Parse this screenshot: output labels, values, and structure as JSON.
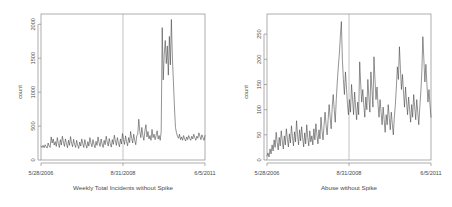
{
  "figure": {
    "background": "#ffffff",
    "line_color": "#3a3a3a",
    "frame_color": "#8a8a8a",
    "vline_color": "#9a9a9a",
    "panel_count": 2
  },
  "chart_data": [
    {
      "type": "line",
      "title": "Weekly Total Incidents without Spike",
      "xlabel": "Weekly Total Incidents without Spike",
      "ylabel": "count",
      "ylim": [
        0,
        2150
      ],
      "yticks": [
        0,
        500,
        1000,
        1500,
        2000
      ],
      "ytick_labels": [
        "0",
        "500",
        "1000",
        "1500",
        "2000"
      ],
      "xtick_labels": [
        "5/28/2006",
        "8/31/2008",
        "6/5/2011"
      ],
      "xtick_positions": [
        0,
        0.5,
        1.0
      ],
      "grid": false,
      "legend": "none",
      "annotations": [
        {
          "type": "vline",
          "x": 0.5,
          "label": "8/31/2008"
        }
      ],
      "x": [
        0,
        0.0062,
        0.0124,
        0.0186,
        0.0248,
        0.031,
        0.0372,
        0.0435,
        0.0497,
        0.0559,
        0.0621,
        0.0683,
        0.0745,
        0.0807,
        0.0869,
        0.0932,
        0.0994,
        0.1056,
        0.1118,
        0.118,
        0.1242,
        0.1304,
        0.1366,
        0.1429,
        0.1491,
        0.1553,
        0.1615,
        0.1677,
        0.1739,
        0.1801,
        0.1863,
        0.1925,
        0.1988,
        0.205,
        0.2112,
        0.2174,
        0.2236,
        0.2298,
        0.236,
        0.2422,
        0.2484,
        0.2547,
        0.2609,
        0.2671,
        0.2733,
        0.2795,
        0.2857,
        0.2919,
        0.2981,
        0.3043,
        0.3106,
        0.3168,
        0.323,
        0.3292,
        0.3354,
        0.3416,
        0.3478,
        0.354,
        0.3602,
        0.3665,
        0.3727,
        0.3789,
        0.3851,
        0.3913,
        0.3975,
        0.4037,
        0.4099,
        0.4161,
        0.4224,
        0.4286,
        0.4348,
        0.441,
        0.4472,
        0.4534,
        0.4596,
        0.4658,
        0.472,
        0.4783,
        0.4845,
        0.4907,
        0.4969,
        0.5031,
        0.5093,
        0.5155,
        0.5217,
        0.528,
        0.5342,
        0.5404,
        0.5466,
        0.5528,
        0.559,
        0.5652,
        0.5714,
        0.5776,
        0.5839,
        0.5901,
        0.5963,
        0.6025,
        0.6087,
        0.6149,
        0.6211,
        0.6273,
        0.6335,
        0.6398,
        0.646,
        0.6522,
        0.6584,
        0.6646,
        0.6708,
        0.677,
        0.6832,
        0.6894,
        0.6957,
        0.7019,
        0.7081,
        0.7143,
        0.7205,
        0.7267,
        0.7329,
        0.7391,
        0.7453,
        0.7516,
        0.7578,
        0.764,
        0.7702,
        0.7764,
        0.7826,
        0.7888,
        0.795,
        0.8012,
        0.8075,
        0.8137,
        0.8199,
        0.8261,
        0.8323,
        0.8385,
        0.8447,
        0.8509,
        0.8571,
        0.8634,
        0.8696,
        0.8758,
        0.882,
        0.8882,
        0.8944,
        0.9006,
        0.9068,
        0.913,
        0.9193,
        0.9255,
        0.9317,
        0.9379,
        0.9441,
        0.9503,
        0.9565,
        0.9627,
        0.9689,
        0.9752,
        0.9814,
        0.9876,
        0.9938,
        1.0
      ],
      "values": [
        205,
        185,
        215,
        180,
        225,
        195,
        175,
        250,
        205,
        185,
        340,
        250,
        310,
        220,
        270,
        200,
        330,
        245,
        185,
        300,
        220,
        350,
        265,
        200,
        310,
        240,
        180,
        290,
        215,
        345,
        250,
        195,
        305,
        230,
        185,
        290,
        220,
        170,
        265,
        205,
        310,
        240,
        185,
        300,
        225,
        175,
        270,
        205,
        330,
        250,
        195,
        300,
        230,
        180,
        275,
        215,
        340,
        255,
        200,
        310,
        235,
        185,
        290,
        225,
        350,
        265,
        205,
        315,
        240,
        190,
        300,
        230,
        365,
        280,
        215,
        330,
        250,
        195,
        310,
        235,
        390,
        300,
        230,
        355,
        270,
        210,
        330,
        255,
        420,
        320,
        250,
        380,
        290,
        225,
        355,
        380,
        600,
        420,
        330,
        480,
        360,
        290,
        430,
        520,
        340,
        420,
        310,
        360,
        290,
        450,
        330,
        380,
        300,
        360,
        430,
        310,
        360,
        290,
        420,
        1950,
        1180,
        1560,
        1760,
        1420,
        1680,
        1250,
        1820,
        1400,
        2070,
        1500,
        1150,
        780,
        480,
        400,
        350,
        320,
        380,
        300,
        340,
        290,
        360,
        310,
        280,
        340,
        300,
        360,
        320,
        290,
        350,
        310,
        380,
        330,
        290,
        350,
        320,
        400,
        350,
        300,
        370,
        330,
        290,
        360,
        320,
        880,
        650,
        430,
        520,
        400,
        480,
        1060,
        700,
        520,
        620,
        470,
        400,
        560,
        480,
        420,
        530,
        460,
        390,
        520,
        450,
        380,
        560,
        490,
        420,
        980,
        620,
        430
      ]
    },
    {
      "type": "line",
      "title": "Abuse without Spike",
      "xlabel": "Abuse without Spike",
      "ylabel": "count",
      "ylim": [
        0,
        290
      ],
      "yticks": [
        0,
        50,
        100,
        150,
        200,
        250
      ],
      "ytick_labels": [
        "0",
        "50",
        "100",
        "150",
        "200",
        "250"
      ],
      "xtick_labels": [
        "5/28/2006",
        "8/31/2008",
        "6/5/2011"
      ],
      "xtick_positions": [
        0,
        0.5,
        1.0
      ],
      "grid": false,
      "legend": "none",
      "annotations": [
        {
          "type": "vline",
          "x": 0.5,
          "label": "8/31/2008"
        }
      ],
      "x": [
        0,
        0.0062,
        0.0124,
        0.0186,
        0.0248,
        0.031,
        0.0372,
        0.0435,
        0.0497,
        0.0559,
        0.0621,
        0.0683,
        0.0745,
        0.0807,
        0.0869,
        0.0932,
        0.0994,
        0.1056,
        0.1118,
        0.118,
        0.1242,
        0.1304,
        0.1366,
        0.1429,
        0.1491,
        0.1553,
        0.1615,
        0.1677,
        0.1739,
        0.1801,
        0.1863,
        0.1925,
        0.1988,
        0.205,
        0.2112,
        0.2174,
        0.2236,
        0.2298,
        0.236,
        0.2422,
        0.2484,
        0.2547,
        0.2609,
        0.2671,
        0.2733,
        0.2795,
        0.2857,
        0.2919,
        0.2981,
        0.3043,
        0.3106,
        0.3168,
        0.323,
        0.3292,
        0.3354,
        0.3416,
        0.3478,
        0.354,
        0.3602,
        0.3665,
        0.3727,
        0.3789,
        0.3851,
        0.3913,
        0.3975,
        0.4037,
        0.4099,
        0.4161,
        0.4224,
        0.4286,
        0.4348,
        0.441,
        0.4472,
        0.4534,
        0.4596,
        0.4658,
        0.472,
        0.4783,
        0.4845,
        0.4907,
        0.4969,
        0.5031,
        0.5093,
        0.5155,
        0.5217,
        0.528,
        0.5342,
        0.5404,
        0.5466,
        0.5528,
        0.559,
        0.5652,
        0.5714,
        0.5776,
        0.5839,
        0.5901,
        0.5963,
        0.6025,
        0.6087,
        0.6149,
        0.6211,
        0.6273,
        0.6335,
        0.6398,
        0.646,
        0.6522,
        0.6584,
        0.6646,
        0.6708,
        0.677,
        0.6832,
        0.6894,
        0.6957,
        0.7019,
        0.7081,
        0.7143,
        0.7205,
        0.7267,
        0.7329,
        0.7391,
        0.7453,
        0.7516,
        0.7578,
        0.764,
        0.7702,
        0.7764,
        0.7826,
        0.7888,
        0.795,
        0.8012,
        0.8075,
        0.8137,
        0.8199,
        0.8261,
        0.8323,
        0.8385,
        0.8447,
        0.8509,
        0.8571,
        0.8634,
        0.8696,
        0.8758,
        0.882,
        0.8882,
        0.8944,
        0.9006,
        0.9068,
        0.913,
        0.9193,
        0.9255,
        0.9317,
        0.9379,
        0.9441,
        0.9503,
        0.9565,
        0.9627,
        0.9689,
        0.9752,
        0.9814,
        0.9876,
        0.9938,
        1.0
      ],
      "values": [
        8,
        14,
        6,
        22,
        12,
        30,
        18,
        40,
        25,
        55,
        35,
        20,
        45,
        28,
        58,
        38,
        22,
        48,
        30,
        62,
        42,
        26,
        52,
        34,
        68,
        46,
        28,
        56,
        36,
        78,
        50,
        30,
        60,
        38,
        66,
        44,
        26,
        54,
        32,
        70,
        45,
        28,
        58,
        36,
        48,
        30,
        62,
        40,
        72,
        50,
        32,
        60,
        42,
        85,
        58,
        40,
        68,
        95,
        70,
        50,
        80,
        110,
        85,
        62,
        105,
        130,
        100,
        75,
        120,
        155,
        185,
        210,
        245,
        275,
        200,
        160,
        130,
        175,
        145,
        110,
        90,
        120,
        95,
        150,
        120,
        90,
        135,
        105,
        80,
        115,
        90,
        195,
        150,
        115,
        140,
        110,
        85,
        125,
        100,
        160,
        125,
        95,
        175,
        140,
        105,
        205,
        160,
        120,
        145,
        110,
        85,
        120,
        95,
        70,
        105,
        80,
        55,
        90,
        70,
        110,
        85,
        60,
        95,
        72,
        50,
        85,
        110,
        145,
        185,
        160,
        225,
        180,
        140,
        170,
        135,
        105,
        145,
        115,
        90,
        125,
        100,
        75,
        110,
        85,
        130,
        105,
        80,
        120,
        95,
        70,
        105,
        135,
        175,
        245,
        200,
        155,
        190,
        150,
        115,
        140,
        110,
        85,
        120,
        95,
        115,
        90,
        70,
        105,
        125,
        100,
        75,
        110,
        85,
        60
      ]
    }
  ],
  "panels": [
    {
      "id": "left-panel",
      "title": "Weekly Total Incidents without Spike",
      "ylabel": "count",
      "ytick_labels": [
        "0",
        "500",
        "1000",
        "1500",
        "2000"
      ],
      "xtick_labels": [
        "5/28/2006",
        "8/31/2008",
        "6/5/2011"
      ]
    },
    {
      "id": "right-panel",
      "title": "Abuse without Spike",
      "ylabel": "count",
      "ytick_labels": [
        "0",
        "50",
        "100",
        "150",
        "200",
        "250"
      ],
      "xtick_labels": [
        "5/28/2006",
        "8/31/2008",
        "6/5/2011"
      ]
    }
  ]
}
